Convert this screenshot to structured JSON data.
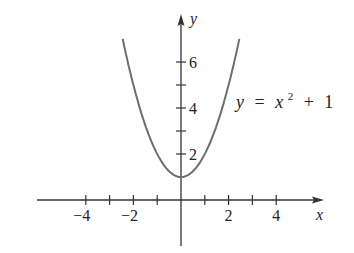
{
  "chart_data": {
    "type": "line",
    "title": "",
    "equation": "y = x² + 1",
    "equation_parts": {
      "lhs": "y",
      "eq": "=",
      "var": "x",
      "exp": "2",
      "plus": "+",
      "const": "1"
    },
    "xlabel": "x",
    "ylabel": "y",
    "xlim": [
      -6,
      6
    ],
    "ylim": [
      -1.5,
      8
    ],
    "x_ticks": [
      -4,
      -3,
      -2,
      -1,
      1,
      2,
      3,
      4
    ],
    "x_tick_labels": [
      {
        "value": -4,
        "label": "−4"
      },
      {
        "value": -2,
        "label": "−2"
      },
      {
        "value": 2,
        "label": "2"
      },
      {
        "value": 4,
        "label": "4"
      }
    ],
    "y_ticks": [
      2,
      3,
      4,
      5,
      6
    ],
    "y_tick_labels": [
      {
        "value": 2,
        "label": "2"
      },
      {
        "value": 4,
        "label": "4"
      },
      {
        "value": 6,
        "label": "6"
      }
    ],
    "grid": false,
    "series": [
      {
        "name": "y = x^2 + 1",
        "x": [
          -2.45,
          -2,
          -1.5,
          -1,
          -0.5,
          0,
          0.5,
          1,
          1.5,
          2,
          2.45
        ],
        "y": [
          7.0,
          5,
          3.25,
          2,
          1.25,
          1,
          1.25,
          2,
          3.25,
          5,
          7.0
        ]
      }
    ],
    "colors": {
      "curve": "#6e6e6e",
      "axes": "#333333"
    }
  }
}
